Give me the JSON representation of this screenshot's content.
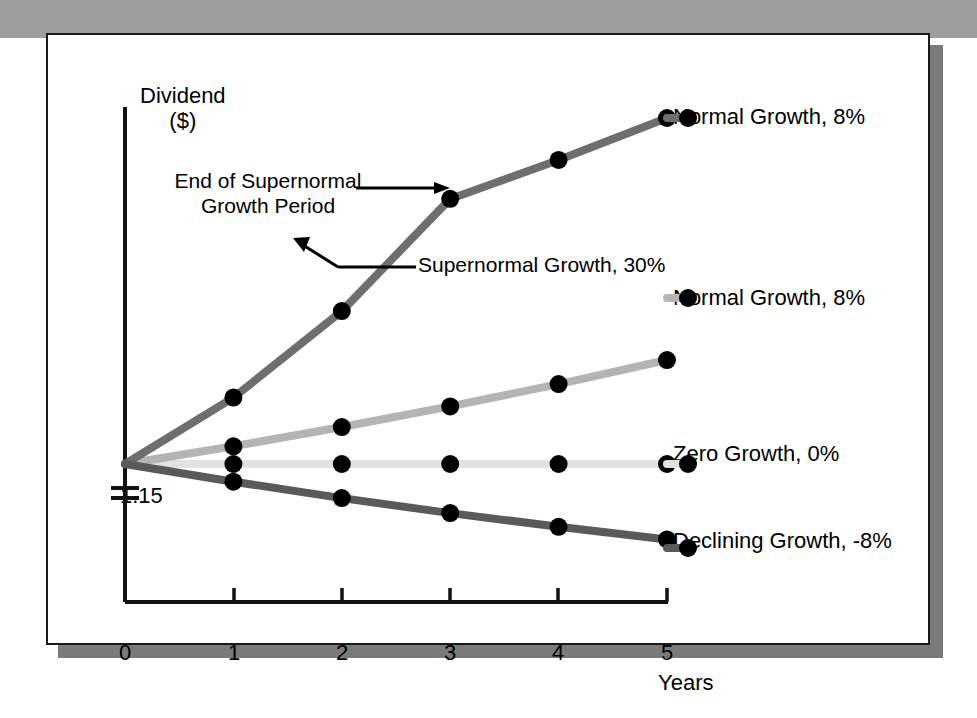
{
  "figure": {
    "background_color": "#ffffff",
    "border_color": "#1a1a1a",
    "shadow_color": "#7a7a7a",
    "top_bar_color": "#9e9e9e",
    "bottom_rule_color": "#a8a8a8"
  },
  "axes": {
    "y_title_line1": "Dividend",
    "y_title_line2": "($)",
    "x_title": "Years",
    "y_origin_label": "1.15",
    "x_tick_labels": [
      "0",
      "1",
      "2",
      "3",
      "4",
      "5"
    ],
    "axis_break": true
  },
  "annotations": {
    "end_supernormal_line1": "End of Supernormal",
    "end_supernormal_line2": "Growth Period",
    "supernormal_callout": "Supernormal Growth, 30%"
  },
  "chart_data": {
    "type": "line",
    "title": "",
    "subtitle": "",
    "xlabel": "Years",
    "ylabel": "Dividend ($)",
    "x": [
      0,
      1,
      2,
      3,
      4,
      5
    ],
    "xlim": [
      0,
      5
    ],
    "ylim": [
      0.72,
      2.9
    ],
    "y_base_value": 1.15,
    "grid": false,
    "legend_position": "right-inline",
    "axis_break_below_base": true,
    "series": [
      {
        "name": "Supernormal Growth, 30%",
        "label": "Normal Growth, 8%",
        "color": "#6e6e6e",
        "width": 8,
        "values": [
          1.15,
          1.495,
          1.944,
          2.527,
          2.729,
          2.947
        ],
        "growth_rates": [
          "30%",
          "30%",
          "30%",
          "8%",
          "8%"
        ],
        "markers": [
          1,
          2,
          3,
          4,
          5
        ]
      },
      {
        "name": "Normal Growth, 8%",
        "label": "Normal Growth, 8%",
        "color": "#b4b4b4",
        "width": 8,
        "values": [
          1.15,
          1.242,
          1.342,
          1.449,
          1.565,
          1.69
        ],
        "growth_rates": [
          "8%",
          "8%",
          "8%",
          "8%",
          "8%"
        ],
        "markers": [
          1,
          2,
          3,
          4,
          5
        ]
      },
      {
        "name": "Zero Growth, 0%",
        "label": "Zero Growth, 0%",
        "color": "#e2e2e2",
        "width": 8,
        "values": [
          1.15,
          1.15,
          1.15,
          1.15,
          1.15,
          1.15
        ],
        "growth_rates": [
          "0%",
          "0%",
          "0%",
          "0%",
          "0%"
        ],
        "markers": [
          1,
          2,
          3,
          4,
          5
        ]
      },
      {
        "name": "Declining Growth, -8%",
        "label": "Declining Growth, -8%",
        "color": "#5a5a5a",
        "width": 8,
        "values": [
          1.15,
          1.058,
          0.973,
          0.895,
          0.824,
          0.758
        ],
        "growth_rates": [
          "-8%",
          "-8%",
          "-8%",
          "-8%",
          "-8%"
        ],
        "markers": [
          1,
          2,
          3,
          4,
          5
        ]
      }
    ],
    "series_labels": [
      "Normal Growth, 8%",
      "Normal Growth, 8%",
      "Zero Growth, 0%",
      "Declining Growth, -8%"
    ],
    "marker_color": "#000000",
    "marker_size": 9
  }
}
